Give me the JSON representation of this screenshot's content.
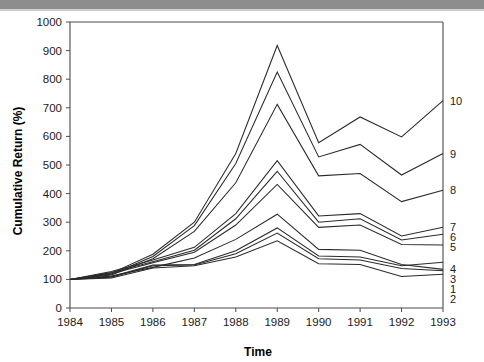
{
  "figure": {
    "background_color": "#ffffff",
    "ink_color": "#2a2a2a",
    "scan_band_color": "#8d8d8d"
  },
  "chart_data": {
    "type": "line",
    "title": "",
    "xlabel": "Time",
    "ylabel": "Cumulative Return (%)",
    "x": [
      1984,
      1985,
      1986,
      1987,
      1988,
      1989,
      1990,
      1991,
      1992,
      1993
    ],
    "xtick_labels": [
      "1984",
      "1985",
      "1986",
      "1987",
      "1988",
      "1989",
      "1990",
      "1991",
      "1992",
      "1993"
    ],
    "ytick_labels": [
      "0",
      "100",
      "200",
      "300",
      "400",
      "500",
      "600",
      "700",
      "800",
      "900",
      "1000"
    ],
    "ytick_values": [
      0,
      100,
      200,
      300,
      400,
      500,
      600,
      700,
      800,
      900,
      1000
    ],
    "xlim": [
      1984,
      1993
    ],
    "ylim": [
      0,
      1000
    ],
    "grid": false,
    "legend_position": "right-edge-inline",
    "series": [
      {
        "name": "10",
        "label": "10",
        "label_value": 725,
        "values": [
          100,
          122,
          188,
          300,
          540,
          918,
          578,
          668,
          598,
          725
        ]
      },
      {
        "name": "9",
        "label": "9",
        "label_value": 540,
        "values": [
          100,
          118,
          180,
          288,
          505,
          825,
          528,
          572,
          465,
          540
        ]
      },
      {
        "name": "8",
        "label": "8",
        "label_value": 412,
        "values": [
          100,
          115,
          172,
          268,
          438,
          712,
          462,
          470,
          372,
          412
        ]
      },
      {
        "name": "7",
        "label": "7",
        "label_value": 282,
        "values": [
          100,
          128,
          168,
          212,
          330,
          515,
          322,
          330,
          252,
          282
        ]
      },
      {
        "name": "6",
        "label": "6",
        "label_value": 258,
        "values": [
          100,
          124,
          162,
          202,
          312,
          478,
          300,
          312,
          238,
          258
        ]
      },
      {
        "name": "5",
        "label": "5",
        "label_value": 220,
        "values": [
          100,
          120,
          158,
          195,
          290,
          432,
          282,
          290,
          222,
          220
        ]
      },
      {
        "name": "4",
        "label": "4",
        "label_value": 135,
        "values": [
          100,
          112,
          142,
          175,
          240,
          328,
          205,
          202,
          152,
          135
        ]
      },
      {
        "name": "3",
        "label": "3",
        "label_value": 160,
        "values": [
          100,
          110,
          150,
          152,
          200,
          280,
          182,
          178,
          148,
          160
        ]
      },
      {
        "name": "1",
        "label": "1",
        "label_value": 130,
        "values": [
          100,
          108,
          148,
          150,
          190,
          262,
          172,
          168,
          138,
          130
        ]
      },
      {
        "name": "2",
        "label": "2",
        "label_value": 118,
        "values": [
          100,
          105,
          140,
          148,
          178,
          235,
          155,
          152,
          110,
          118
        ]
      }
    ]
  }
}
